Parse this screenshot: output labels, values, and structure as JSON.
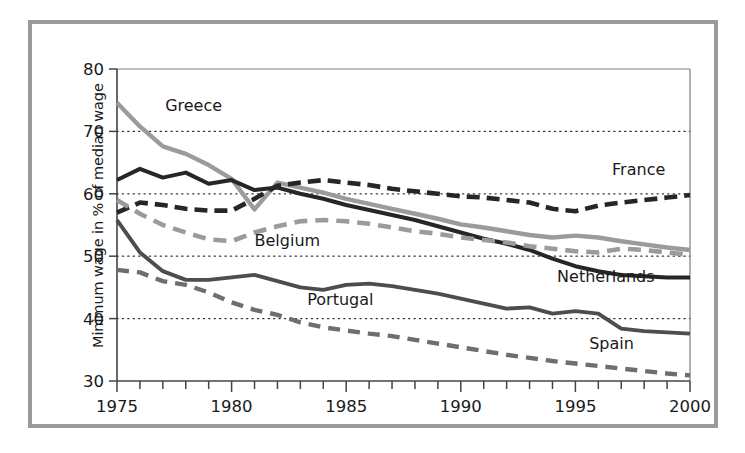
{
  "figure": {
    "frame_color": "#9a9a9a",
    "background": "#ffffff"
  },
  "axes": {
    "ylabel": "Minimum wage in % of median wage",
    "xlabel": "",
    "ytick_labels": [
      "30",
      "40",
      "50",
      "60",
      "70",
      "80"
    ],
    "xtick_labels": [
      "1975",
      "1980",
      "1985",
      "1990",
      "1995",
      "2000"
    ]
  },
  "chart_data": {
    "type": "line",
    "title": "",
    "xlabel": "",
    "ylabel": "Minimum wage in % of median wage",
    "xlim": [
      1975,
      2000
    ],
    "ylim": [
      30,
      80
    ],
    "yticks": [
      30,
      40,
      50,
      60,
      70,
      80
    ],
    "xticks": [
      1975,
      1980,
      1985,
      1990,
      1995,
      2000
    ],
    "xtick_minor_step": 1,
    "grid": "horizontal-dotted",
    "gridlines_at": [
      40,
      50,
      60,
      70
    ],
    "legend": "inline-labels",
    "x": [
      1975,
      1976,
      1977,
      1978,
      1979,
      1980,
      1981,
      1982,
      1983,
      1984,
      1985,
      1986,
      1987,
      1988,
      1989,
      1990,
      1991,
      1992,
      1993,
      1994,
      1995,
      1996,
      1997,
      1998,
      1999,
      2000
    ],
    "series": [
      {
        "name": "Greece",
        "color": "#9b9b9b",
        "style": "solid",
        "label_x": 1977.1,
        "label_y": 73.2,
        "values": [
          74.6,
          70.8,
          67.6,
          66.4,
          64.6,
          62.4,
          57.5,
          61.8,
          61.0,
          60.2,
          59.2,
          58.4,
          57.6,
          56.8,
          56.0,
          55.1,
          54.6,
          54.0,
          53.4,
          53.0,
          53.3,
          53.0,
          52.4,
          51.9,
          51.4,
          51.0
        ]
      },
      {
        "name": "France",
        "color": "#262626",
        "style": "dashed",
        "label_x": 1996.6,
        "label_y": 63.0,
        "values": [
          57.0,
          58.6,
          58.2,
          57.6,
          57.3,
          57.3,
          59.2,
          61.3,
          61.8,
          62.2,
          61.8,
          61.4,
          60.8,
          60.4,
          60.0,
          59.6,
          59.4,
          59.0,
          58.6,
          57.6,
          57.2,
          58.1,
          58.6,
          59.0,
          59.4,
          59.8
        ]
      },
      {
        "name": "Netherlands",
        "color": "#262626",
        "style": "solid",
        "label_x": 1994.2,
        "label_y": 45.8,
        "values": [
          62.2,
          64.0,
          62.6,
          63.4,
          61.6,
          62.2,
          60.6,
          61.0,
          60.0,
          59.2,
          58.2,
          57.4,
          56.6,
          55.8,
          54.8,
          53.8,
          52.8,
          52.0,
          51.0,
          49.6,
          48.4,
          47.6,
          47.0,
          46.8,
          46.6,
          46.6
        ]
      },
      {
        "name": "Belgium",
        "color": "#9b9b9b",
        "style": "dashed",
        "label_x": 1981.0,
        "label_y": 51.7,
        "values": [
          59.0,
          56.8,
          55.0,
          53.8,
          52.7,
          52.4,
          53.8,
          54.8,
          55.6,
          55.8,
          55.6,
          55.2,
          54.6,
          54.0,
          53.6,
          53.0,
          52.6,
          52.2,
          51.6,
          51.2,
          50.8,
          50.6,
          51.2,
          51.0,
          50.6,
          50.2
        ]
      },
      {
        "name": "Portugal",
        "color": "#4d4d4d",
        "style": "solid",
        "label_x": 1983.3,
        "label_y": 42.2,
        "values": [
          55.8,
          50.6,
          47.6,
          46.2,
          46.2,
          46.6,
          47.0,
          46.0,
          45.0,
          44.6,
          45.4,
          45.6,
          45.2,
          44.6,
          44.0,
          43.2,
          42.4,
          41.6,
          41.8,
          40.8,
          41.2,
          40.8,
          38.4,
          38.0,
          37.8,
          37.6
        ]
      },
      {
        "name": "Spain",
        "color": "#6e6e6e",
        "style": "dashed",
        "label_x": 1995.6,
        "label_y": 35.2,
        "values": [
          47.8,
          47.4,
          46.0,
          45.4,
          44.2,
          42.6,
          41.4,
          40.6,
          39.4,
          38.6,
          38.1,
          37.6,
          37.2,
          36.6,
          36.0,
          35.4,
          34.8,
          34.2,
          33.7,
          33.2,
          32.8,
          32.4,
          32.0,
          31.6,
          31.2,
          30.9
        ]
      }
    ]
  }
}
